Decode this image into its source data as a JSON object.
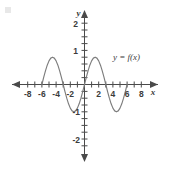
{
  "chart_data": {
    "type": "line",
    "title": "",
    "xlabel": "x",
    "ylabel": "y",
    "grid": false,
    "legend_position": "inside-right",
    "annotations": [
      {
        "text": "y = f(x)",
        "x": 4.6,
        "y": 1.35
      }
    ],
    "xlim": [
      -9.2,
      9.2
    ],
    "ylim": [
      -2.6,
      2.6
    ],
    "xticks": [
      -8,
      -7,
      -6,
      -5,
      -4,
      -3,
      -2,
      -1,
      1,
      2,
      3,
      4,
      5,
      6,
      7,
      8
    ],
    "yticks": [
      -2,
      -1,
      1,
      2
    ],
    "xtick_labels": [
      "-8",
      "-6",
      "-4",
      "-2",
      "2",
      "4",
      "6",
      "8"
    ],
    "xtick_label_values": [
      -8,
      -6,
      -4,
      -2,
      2,
      4,
      6,
      8
    ],
    "ytick_labels": [
      "2",
      "1",
      "-1",
      "-2"
    ],
    "ytick_label_values": [
      2,
      1,
      -1,
      -2
    ],
    "series": [
      {
        "name": "y = f(x)",
        "color": "#7d7d7d",
        "description": "sinusoid, amplitude 1, period 6, odd symmetry about origin",
        "x": [
          -6.0,
          -5.75,
          -5.5,
          -5.25,
          -5.0,
          -4.75,
          -4.5,
          -4.25,
          -4.0,
          -3.75,
          -3.5,
          -3.25,
          -3.0,
          -2.75,
          -2.5,
          -2.25,
          -2.0,
          -1.75,
          -1.5,
          -1.25,
          -1.0,
          -0.75,
          -0.5,
          -0.25,
          0.0,
          0.25,
          0.5,
          0.75,
          1.0,
          1.25,
          1.5,
          1.75,
          2.0,
          2.25,
          2.5,
          2.75,
          3.0,
          3.25,
          3.5,
          3.75,
          4.0,
          4.25,
          4.5,
          4.75,
          5.0,
          5.25,
          5.5,
          5.75,
          6.0
        ],
        "y": [
          0.0,
          0.259,
          0.5,
          0.707,
          0.866,
          0.966,
          1.0,
          0.966,
          0.866,
          0.707,
          0.5,
          0.259,
          0.0,
          -0.259,
          -0.5,
          -0.707,
          -0.866,
          -0.966,
          -1.0,
          -0.966,
          -0.866,
          -0.707,
          -0.5,
          -0.259,
          0.0,
          0.259,
          0.5,
          0.707,
          0.866,
          0.966,
          1.0,
          0.966,
          0.866,
          0.707,
          0.5,
          0.259,
          0.0,
          -0.259,
          -0.5,
          -0.707,
          -0.866,
          -0.966,
          -1.0,
          -0.966,
          -0.866,
          -0.707,
          -0.5,
          -0.259,
          0.0
        ]
      }
    ],
    "key_points": {
      "zeros": [
        -6,
        -3,
        0,
        3,
        6
      ],
      "maxima": [
        {
          "x": -4.5,
          "y": 1
        },
        {
          "x": 1.5,
          "y": 1
        }
      ],
      "minima": [
        {
          "x": -1.5,
          "y": -1
        },
        {
          "x": 4.5,
          "y": -1
        }
      ],
      "amplitude": 1,
      "period": 6
    },
    "axis_arrows": [
      "left",
      "right",
      "up",
      "down"
    ]
  }
}
